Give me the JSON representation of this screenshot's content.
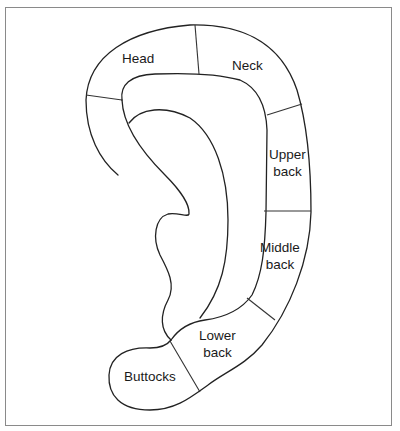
{
  "diagram": {
    "type": "auricular zone map",
    "regions": [
      {
        "id": "head",
        "label": "Head"
      },
      {
        "id": "neck",
        "label": "Neck"
      },
      {
        "id": "upper_back",
        "label_line1": "Upper",
        "label_line2": "back"
      },
      {
        "id": "middle_back",
        "label_line1": "Middle",
        "label_line2": "back"
      },
      {
        "id": "lower_back",
        "label_line1": "Lower",
        "label_line2": "back"
      },
      {
        "id": "buttocks",
        "label": "Buttocks"
      }
    ],
    "colors": {
      "stroke": "#222222",
      "frame": "#8a8a8a",
      "background": "#ffffff"
    }
  }
}
